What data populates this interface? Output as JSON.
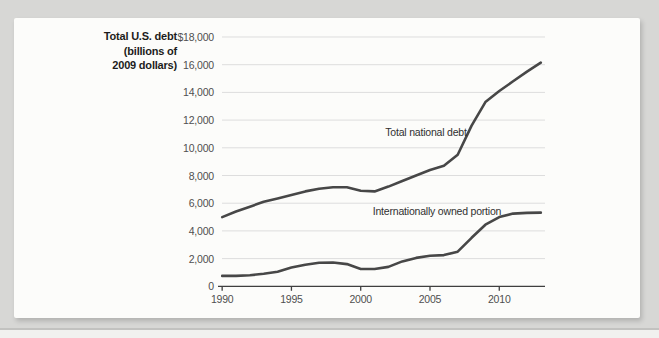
{
  "figure": {
    "y_axis_title": {
      "line1": "Total U.S. debt",
      "line2": "(billions of",
      "line3": "2009 dollars)"
    }
  },
  "chart_data": {
    "type": "line",
    "title": "",
    "y_axis_label": "Total U.S. debt (billions of 2009 dollars)",
    "x": [
      1990,
      1991,
      1992,
      1993,
      1994,
      1995,
      1996,
      1997,
      1998,
      1999,
      2000,
      2001,
      2002,
      2003,
      2004,
      2005,
      2006,
      2007,
      2008,
      2009,
      2010,
      2011,
      2012,
      2013
    ],
    "series": [
      {
        "name": "Total national debt",
        "values": [
          5000,
          5400,
          5750,
          6100,
          6350,
          6600,
          6850,
          7050,
          7150,
          7150,
          6900,
          6850,
          7200,
          7600,
          8000,
          8400,
          8700,
          9500,
          11600,
          13300,
          14100,
          14800,
          15500,
          16150
        ]
      },
      {
        "name": "Internationally owned portion",
        "values": [
          750,
          750,
          800,
          900,
          1050,
          1350,
          1550,
          1700,
          1720,
          1600,
          1250,
          1250,
          1400,
          1800,
          2050,
          2200,
          2250,
          2500,
          3500,
          4450,
          5000,
          5250,
          5300,
          5320
        ]
      }
    ],
    "y_ticks": [
      {
        "value": 18000,
        "label": "$18,000"
      },
      {
        "value": 16000,
        "label": "16,000"
      },
      {
        "value": 14000,
        "label": "14,000"
      },
      {
        "value": 12000,
        "label": "12,000"
      },
      {
        "value": 10000,
        "label": "10,000"
      },
      {
        "value": 8000,
        "label": "8,000"
      },
      {
        "value": 6000,
        "label": "6,000"
      },
      {
        "value": 4000,
        "label": "4,000"
      },
      {
        "value": 2000,
        "label": "2,000"
      },
      {
        "value": 0,
        "label": "0"
      }
    ],
    "x_ticks": [
      {
        "value": 1990,
        "label": "1990"
      },
      {
        "value": 1995,
        "label": "1995"
      },
      {
        "value": 2000,
        "label": "2000"
      },
      {
        "value": 2005,
        "label": "2005"
      },
      {
        "value": 2010,
        "label": "2010"
      }
    ],
    "ylim": [
      0,
      18000
    ],
    "xlim": [
      1989.7,
      2013.3
    ],
    "grid": "horizontal",
    "legend": "inline-annotations",
    "colors": {
      "line": "#474747",
      "grid": "#dddddd",
      "axis": "#3f3f3f",
      "tick_text": "#4f4f4f"
    }
  }
}
